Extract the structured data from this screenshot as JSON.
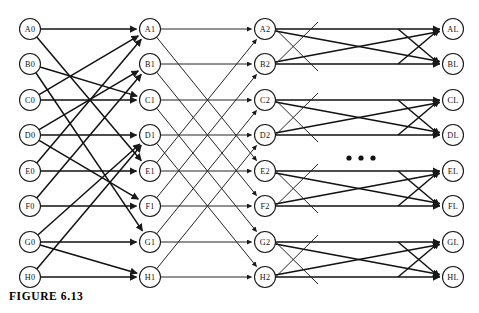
{
  "figure": {
    "caption": "FIGURE 6.13",
    "background_color": "#ffffff",
    "line_color": "#242424",
    "node_fill": "#ffffff",
    "node_stroke": "#1a1a1a"
  },
  "ellipsis": {
    "label": "...",
    "dot_count": 3,
    "x_positions": [
      349,
      361,
      373
    ],
    "y": 158
  },
  "layout": {
    "rows": 8,
    "row_labels": [
      "A",
      "B",
      "C",
      "D",
      "E",
      "F",
      "G",
      "H"
    ],
    "columns": 4,
    "column_suffixes": [
      "0",
      "1",
      "2",
      "L"
    ],
    "column_x": [
      30,
      150,
      265,
      453
    ],
    "row_y": [
      29,
      64,
      100,
      135,
      171,
      206,
      242,
      277
    ],
    "node_radius": 10.5
  },
  "nodes": [
    {
      "id": "A0",
      "label": "A0",
      "col": 0,
      "row": 0
    },
    {
      "id": "B0",
      "label": "B0",
      "col": 0,
      "row": 1
    },
    {
      "id": "C0",
      "label": "C0",
      "col": 0,
      "row": 2
    },
    {
      "id": "D0",
      "label": "D0",
      "col": 0,
      "row": 3
    },
    {
      "id": "E0",
      "label": "E0",
      "col": 0,
      "row": 4
    },
    {
      "id": "F0",
      "label": "F0",
      "col": 0,
      "row": 5
    },
    {
      "id": "G0",
      "label": "G0",
      "col": 0,
      "row": 6
    },
    {
      "id": "H0",
      "label": "H0",
      "col": 0,
      "row": 7
    },
    {
      "id": "A1",
      "label": "A1",
      "col": 1,
      "row": 0
    },
    {
      "id": "B1",
      "label": "B1",
      "col": 1,
      "row": 1
    },
    {
      "id": "C1",
      "label": "C1",
      "col": 1,
      "row": 2
    },
    {
      "id": "D1",
      "label": "D1",
      "col": 1,
      "row": 3
    },
    {
      "id": "E1",
      "label": "E1",
      "col": 1,
      "row": 4
    },
    {
      "id": "F1",
      "label": "F1",
      "col": 1,
      "row": 5
    },
    {
      "id": "G1",
      "label": "G1",
      "col": 1,
      "row": 6
    },
    {
      "id": "H1",
      "label": "H1",
      "col": 1,
      "row": 7
    },
    {
      "id": "A2",
      "label": "A2",
      "col": 2,
      "row": 0
    },
    {
      "id": "B2",
      "label": "B2",
      "col": 2,
      "row": 1
    },
    {
      "id": "C2",
      "label": "C2",
      "col": 2,
      "row": 2
    },
    {
      "id": "D2",
      "label": "D2",
      "col": 2,
      "row": 3
    },
    {
      "id": "E2",
      "label": "E2",
      "col": 2,
      "row": 4
    },
    {
      "id": "F2",
      "label": "F2",
      "col": 2,
      "row": 5
    },
    {
      "id": "G2",
      "label": "G2",
      "col": 2,
      "row": 6
    },
    {
      "id": "H2",
      "label": "H2",
      "col": 2,
      "row": 7
    },
    {
      "id": "AL",
      "label": "AL",
      "col": 3,
      "row": 0
    },
    {
      "id": "BL",
      "label": "BL",
      "col": 3,
      "row": 1
    },
    {
      "id": "CL",
      "label": "CL",
      "col": 3,
      "row": 2
    },
    {
      "id": "DL",
      "label": "DL",
      "col": 3,
      "row": 3
    },
    {
      "id": "EL",
      "label": "EL",
      "col": 3,
      "row": 4
    },
    {
      "id": "FL",
      "label": "FL",
      "col": 3,
      "row": 5
    },
    {
      "id": "GL",
      "label": "GL",
      "col": 3,
      "row": 6
    },
    {
      "id": "HL",
      "label": "HL",
      "col": 3,
      "row": 7
    }
  ],
  "edges_stage_0_1": [
    {
      "from": "A0",
      "to": "A1"
    },
    {
      "from": "A0",
      "to": "E1"
    },
    {
      "from": "B0",
      "to": "C1"
    },
    {
      "from": "B0",
      "to": "G1"
    },
    {
      "from": "C0",
      "to": "C1"
    },
    {
      "from": "C0",
      "to": "A1"
    },
    {
      "from": "D0",
      "to": "B1"
    },
    {
      "from": "D0",
      "to": "F1"
    },
    {
      "from": "E0",
      "to": "E1"
    },
    {
      "from": "E0",
      "to": "A1"
    },
    {
      "from": "F0",
      "to": "F1"
    },
    {
      "from": "F0",
      "to": "B1"
    },
    {
      "from": "G0",
      "to": "D1"
    },
    {
      "from": "G0",
      "to": "H1"
    },
    {
      "from": "H0",
      "to": "H1"
    },
    {
      "from": "H0",
      "to": "D1"
    },
    {
      "from": "D0",
      "to": "D1"
    },
    {
      "from": "G0",
      "to": "G1"
    }
  ],
  "edges_stage_1_2": [
    {
      "from": "A1",
      "to": "A2"
    },
    {
      "from": "A1",
      "to": "E2"
    },
    {
      "from": "B1",
      "to": "B2"
    },
    {
      "from": "B1",
      "to": "F2"
    },
    {
      "from": "C1",
      "to": "C2"
    },
    {
      "from": "C1",
      "to": "G2"
    },
    {
      "from": "D1",
      "to": "D2"
    },
    {
      "from": "D1",
      "to": "H2"
    },
    {
      "from": "E1",
      "to": "E2"
    },
    {
      "from": "E1",
      "to": "A2"
    },
    {
      "from": "F1",
      "to": "F2"
    },
    {
      "from": "F1",
      "to": "B2"
    },
    {
      "from": "G1",
      "to": "G2"
    },
    {
      "from": "G1",
      "to": "C2"
    },
    {
      "from": "H1",
      "to": "H2"
    },
    {
      "from": "H1",
      "to": "D2"
    }
  ],
  "edges_stage_last": [
    {
      "from": "A2",
      "to": "AL"
    },
    {
      "from": "A2",
      "to": "BL"
    },
    {
      "from": "B2",
      "to": "BL"
    },
    {
      "from": "B2",
      "to": "AL"
    },
    {
      "from": "C2",
      "to": "CL"
    },
    {
      "from": "C2",
      "to": "DL"
    },
    {
      "from": "D2",
      "to": "DL"
    },
    {
      "from": "D2",
      "to": "CL"
    },
    {
      "from": "E2",
      "to": "EL"
    },
    {
      "from": "E2",
      "to": "FL"
    },
    {
      "from": "F2",
      "to": "FL"
    },
    {
      "from": "F2",
      "to": "EL"
    },
    {
      "from": "G2",
      "to": "GL"
    },
    {
      "from": "G2",
      "to": "HL"
    },
    {
      "from": "H2",
      "to": "HL"
    },
    {
      "from": "H2",
      "to": "GL"
    }
  ]
}
